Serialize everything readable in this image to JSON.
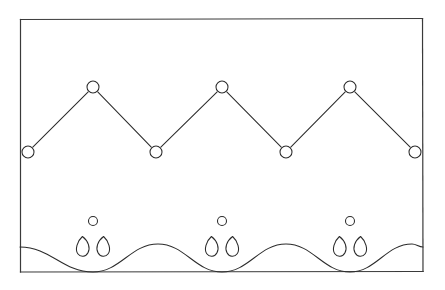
{
  "figure": {
    "width": 445,
    "height": 290,
    "background_color": "#ffffff",
    "ink_color": "#2b2b2b",
    "frame_color": "#3a3a3a"
  },
  "frame": {
    "name": "outer-rectangle",
    "left": 20,
    "top": 18,
    "right": 423,
    "bottom": 272
  },
  "zigzag": {
    "name": "zigzag-polyline",
    "peak_y": 87,
    "valley_y": 152,
    "node_radius": 6,
    "vertices": [
      {
        "label": "valley-1",
        "kind": "valley",
        "x": 28,
        "y": 152
      },
      {
        "label": "peak-1",
        "kind": "peak",
        "x": 93,
        "y": 87
      },
      {
        "label": "valley-2",
        "kind": "valley",
        "x": 156,
        "y": 152
      },
      {
        "label": "peak-2",
        "kind": "peak",
        "x": 222,
        "y": 87
      },
      {
        "label": "valley-3",
        "kind": "valley",
        "x": 286,
        "y": 152
      },
      {
        "label": "peak-3",
        "kind": "peak",
        "x": 350,
        "y": 87
      },
      {
        "label": "valley-4",
        "kind": "valley",
        "x": 415,
        "y": 152
      }
    ]
  },
  "clusters": {
    "name": "petal-clusters",
    "bud_radius": 4.5,
    "items": [
      {
        "label": "cluster-1",
        "x": 93,
        "bud_y": 221,
        "petal_y": 247
      },
      {
        "label": "cluster-2",
        "x": 222,
        "bud_y": 221,
        "petal_y": 247
      },
      {
        "label": "cluster-3",
        "x": 350,
        "bud_y": 221,
        "petal_y": 247
      }
    ]
  },
  "wave": {
    "name": "bottom-wave",
    "start_x": 20,
    "start_y": 247,
    "end_x": 423,
    "end_y": 247,
    "trough_y": 272,
    "crest_y": 244,
    "troughs_x": [
      93,
      222,
      350
    ],
    "crests_x": [
      158,
      286,
      412
    ]
  },
  "chart_data": {
    "type": "line",
    "xlabel": "",
    "ylabel": "",
    "grid": false,
    "legend": "none",
    "series": [
      {
        "name": "zigzag",
        "x": [
          28,
          93,
          156,
          222,
          286,
          350,
          415
        ],
        "values": [
          152,
          87,
          152,
          87,
          152,
          87,
          152
        ],
        "markers": "circle"
      },
      {
        "name": "wave",
        "x": [
          20,
          93,
          158,
          222,
          286,
          350,
          412,
          423
        ],
        "values": [
          247,
          272,
          244,
          272,
          244,
          272,
          244,
          247
        ],
        "markers": "none"
      }
    ]
  }
}
